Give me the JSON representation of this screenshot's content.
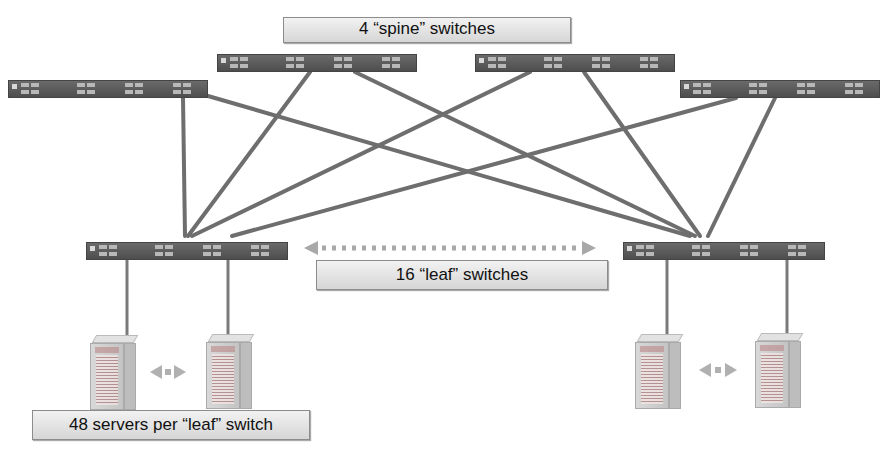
{
  "labels": {
    "spine": "4 “spine” switches",
    "leaf": "16 “leaf” switches",
    "servers": "48 servers per “leaf” switch"
  },
  "colors": {
    "switch_body": "#5a5a5a",
    "link": "#6e6e6e",
    "label_fill": "#e4e4e4",
    "label_border": "#8c8c8c",
    "arrow": "#a8a8a8"
  },
  "topology": {
    "spine_switches": [
      {
        "id": "spine-1",
        "x": 8,
        "y": 80,
        "w": 200
      },
      {
        "id": "spine-2",
        "x": 217,
        "y": 54,
        "w": 200
      },
      {
        "id": "spine-3",
        "x": 475,
        "y": 54,
        "w": 200
      },
      {
        "id": "spine-4",
        "x": 680,
        "y": 80,
        "w": 200
      }
    ],
    "leaf_switches": [
      {
        "id": "leaf-1",
        "x": 86,
        "y": 242,
        "w": 200
      },
      {
        "id": "leaf-2",
        "x": 623,
        "y": 242,
        "w": 200
      }
    ],
    "servers_per_leaf": 48,
    "spine_count": 4,
    "leaf_count": 16
  }
}
